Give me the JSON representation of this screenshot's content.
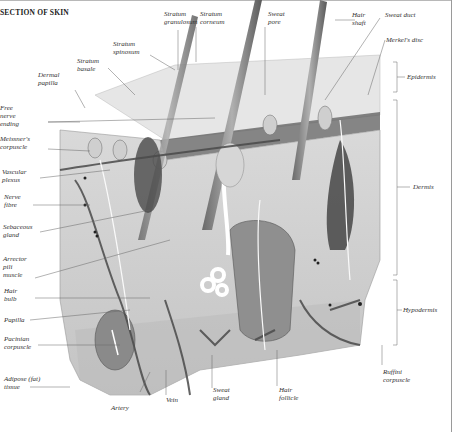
{
  "title": "SECTION OF SKIN",
  "labels": {
    "stratum_granulosum": "Stratum\ngranulosum",
    "stratum_corneum": "Stratum\ncorneum",
    "sweat_pore": "Sweat\npore",
    "hair_shaft": "Hair\nshaft",
    "sweat_duct": "Sweat duct",
    "merkels_disc": "Merkel's disc",
    "stratum_spinosum": "Stratum\nspinosum",
    "stratum_basale": "Stratum\nbasale",
    "dermal_papilla": "Dermal\npapilla",
    "free_nerve_ending": "Free\nnerve\nending",
    "meissners_corpuscle": "Meissner's\ncorpuscle",
    "vascular_plexus": "Vascular\nplexus",
    "nerve_fibre": "Nerve\nfibre",
    "sebaceous_gland": "Sebaceous\ngland",
    "arrector_pili_muscle": "Arrector\npili\nmuscle",
    "hair_bulb": "Hair\nbulb",
    "papilla": "Papilla",
    "pacinian_corpuscle": "Pacinian\ncorpuscle",
    "adipose_tissue": "Adipose (fat)\ntissue",
    "artery": "Artery",
    "vein": "Vein",
    "sweat_gland": "Sweat\ngland",
    "hair_follicle": "Hair\nfollicle",
    "ruffini_corpuscle": "Ruffini\ncorpuscle",
    "epidermis": "Epidermis",
    "dermis": "Dermis",
    "hypodermis": "Hypodermis"
  },
  "layers": [
    "Epidermis",
    "Dermis",
    "Hypodermis"
  ]
}
